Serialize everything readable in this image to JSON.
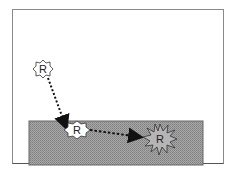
{
  "diagram": {
    "colors": {
      "frame_border": "#8a8a8a",
      "surface_fill": "#9a9a9a",
      "surface_border": "#666666",
      "arrow": "#111111",
      "star_fill_white": "#ffffff",
      "star_fill_gray": "#b5b5b5"
    },
    "nodes": [
      {
        "id": "r1",
        "label": "R",
        "shape": "star-small",
        "fill": "white",
        "x": 43,
        "y": 69
      },
      {
        "id": "r2",
        "label": "R",
        "shape": "star-small",
        "fill": "white",
        "x": 77,
        "y": 130
      },
      {
        "id": "r3",
        "label": "R",
        "shape": "starburst",
        "fill": "gray",
        "x": 160,
        "y": 139
      }
    ],
    "arrows": [
      {
        "from": "r1",
        "to": "r2",
        "style": "dotted"
      },
      {
        "from": "r2",
        "to": "r3",
        "style": "dotted"
      }
    ],
    "surface": {
      "x": 29,
      "y": 121,
      "width": 174,
      "height": 44
    }
  }
}
